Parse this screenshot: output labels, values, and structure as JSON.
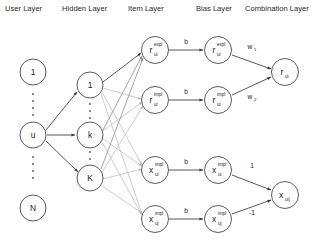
{
  "diagram": {
    "headers": [
      {
        "label": "User Layer",
        "x": 5
      },
      {
        "label": "Hidden Layer",
        "x": 62
      },
      {
        "label": "Item Layer",
        "x": 128
      },
      {
        "label": "Bias Layer",
        "x": 196
      },
      {
        "label": "Combination Layer",
        "x": 245
      }
    ],
    "user_layer": {
      "nodes": [
        {
          "label": "1",
          "sub": "",
          "sup": "",
          "cx": 33,
          "cy": 72
        },
        {
          "label": "u",
          "sub": "",
          "sup": "",
          "cx": 33,
          "cy": 135
        },
        {
          "label": "N",
          "sub": "",
          "sup": "",
          "cx": 33,
          "cy": 208
        }
      ]
    },
    "hidden_layer": {
      "nodes": [
        {
          "label": "1",
          "sub": "",
          "sup": "",
          "cx": 90,
          "cy": 85
        },
        {
          "label": "k",
          "sub": "",
          "sup": "",
          "cx": 90,
          "cy": 135
        },
        {
          "label": "K",
          "sub": "",
          "sup": "",
          "cx": 90,
          "cy": 178
        }
      ]
    },
    "item_layer": {
      "nodes": [
        {
          "label": "r",
          "sub": "ui",
          "sup": "expl",
          "cx": 155,
          "cy": 50
        },
        {
          "label": "r",
          "sub": "ui",
          "sup": "impl",
          "cx": 155,
          "cy": 100
        },
        {
          "label": "x",
          "sub": "ui",
          "sup": "impl",
          "cx": 155,
          "cy": 170
        },
        {
          "label": "x",
          "sub": "uj",
          "sup": "impl",
          "cx": 155,
          "cy": 219
        }
      ]
    },
    "bias_layer": {
      "nodes": [
        {
          "label": "r",
          "sub": "ui",
          "sup": "expl",
          "cx": 218,
          "cy": 50
        },
        {
          "label": "r",
          "sub": "ui",
          "sup": "impl",
          "cx": 218,
          "cy": 100
        },
        {
          "label": "x",
          "sub": "ui",
          "sup": "impl",
          "cx": 218,
          "cy": 170
        },
        {
          "label": "x",
          "sub": "uj",
          "sup": "impl",
          "cx": 218,
          "cy": 219
        }
      ]
    },
    "combination_layer": {
      "nodes": [
        {
          "label": "r",
          "sub": "ui",
          "sup": "",
          "cx": 285,
          "cy": 72
        },
        {
          "label": "x",
          "sub": "uij",
          "sup": "",
          "cx": 285,
          "cy": 195
        }
      ]
    },
    "edge_labels": {
      "bias_weights": [
        {
          "text": "b",
          "x": 186,
          "y": 44
        },
        {
          "text": "b",
          "x": 186,
          "y": 94
        },
        {
          "text": "b",
          "x": 186,
          "y": 164
        },
        {
          "text": "b",
          "x": 186,
          "y": 213
        }
      ],
      "combination_weights": [
        {
          "text": "w",
          "sub": "1",
          "x": 250,
          "y": 49
        },
        {
          "text": "w",
          "sub": "2",
          "x": 250,
          "y": 99
        },
        {
          "text": "1",
          "sub": "",
          "x": 252,
          "y": 168
        },
        {
          "text": "-1",
          "sub": "",
          "x": 252,
          "y": 215
        }
      ]
    },
    "colors": {
      "node_stroke": "#4a4a4a",
      "edge_dark": "#3a3a3a",
      "edge_light": "#c0c0c0",
      "text": "#1a1a1a",
      "background": "#ffffff"
    }
  }
}
